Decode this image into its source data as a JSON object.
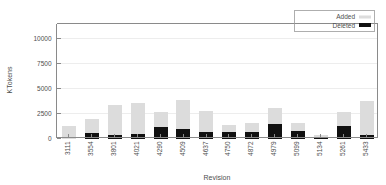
{
  "chart_data": {
    "type": "bar",
    "stacked": true,
    "title": "",
    "xlabel": "Revision",
    "ylabel": "KTokens",
    "categories": [
      "3111",
      "3554",
      "3801",
      "4021",
      "4290",
      "4509",
      "4637",
      "4750",
      "4872",
      "4979",
      "5099",
      "5134",
      "5261",
      "5433"
    ],
    "series": [
      {
        "name": "Deleted",
        "color": "#111111",
        "values": [
          0,
          520,
          400,
          480,
          1130,
          960,
          680,
          660,
          620,
          1420,
          760,
          120,
          1260,
          400
        ]
      },
      {
        "name": "Added",
        "color": "#dcdcdc",
        "values": [
          1220,
          1440,
          2920,
          3110,
          1540,
          2920,
          2120,
          700,
          960,
          1640,
          840,
          270,
          1440,
          3340
        ]
      }
    ],
    "totals": [
      1220,
      1960,
      3320,
      3590,
      2670,
      3880,
      2800,
      1360,
      1580,
      3060,
      1600,
      390,
      2700,
      3740
    ],
    "ylim": [
      0,
      11400
    ],
    "yticks": [
      0,
      2500,
      5000,
      7500,
      10000
    ],
    "ytick_labels": [
      "0",
      "2500",
      "5000",
      "7500",
      "10000"
    ],
    "grid": true,
    "legend_position": "top-right",
    "legend": [
      {
        "label": "Added",
        "swatch": "#dcdcdc"
      },
      {
        "label": "Deleted",
        "swatch": "#111111"
      }
    ]
  }
}
